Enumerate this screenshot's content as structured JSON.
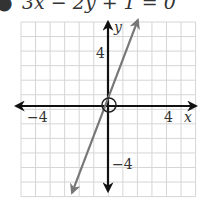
{
  "equation": {
    "bullet": "●",
    "text": "3x − 2y + 1 = 0"
  },
  "chart_data": {
    "type": "line",
    "title": "3x − 2y + 1 = 0",
    "xlabel": "x",
    "ylabel": "y",
    "xlim": [
      -6,
      6
    ],
    "ylim": [
      -6,
      6
    ],
    "grid": true,
    "tick_labels": {
      "x": [
        {
          "value": -4,
          "label": "−4"
        },
        {
          "value": 4,
          "label": "4"
        }
      ],
      "y": [
        {
          "value": 4,
          "label": "4"
        },
        {
          "value": -4,
          "label": "−4"
        }
      ]
    },
    "series": [
      {
        "name": "line",
        "color": "#777777",
        "x": [
          -2.47,
          2.05
        ],
        "y": [
          -5.96,
          5.9
        ],
        "arrows": "both"
      }
    ],
    "annotations": [
      {
        "type": "circle",
        "x": 0,
        "y": 0,
        "label": "origin marker"
      }
    ],
    "colors": {
      "grid": "#d6d6d6",
      "axes": "#111111",
      "line": "#777777"
    }
  }
}
